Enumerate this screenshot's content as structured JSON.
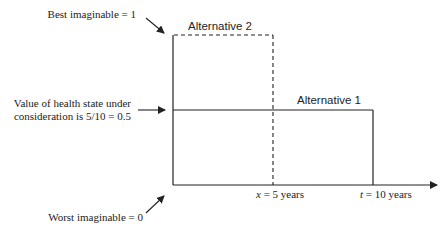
{
  "diagram": {
    "labels": {
      "best": "Best imaginable = 1",
      "value_line1": "Value of health state under",
      "value_line2": "consideration is 5/10 = 0.5",
      "worst": "Worst imaginable = 0",
      "alt2": "Alternative 2",
      "alt1": "Alternative 1",
      "x_var": "x",
      "x_rest": " = 5 years",
      "t_var": "t",
      "t_rest": " = 10 years"
    },
    "colors": {
      "line": "#222222",
      "text": "#222222"
    }
  }
}
